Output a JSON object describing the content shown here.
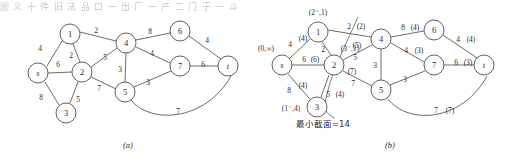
{
  "figure": {
    "top_cut_text": "图 义 十 件 旧 法 品 口 一 出 厂 一 产 二 门 于 一 斗",
    "panels": [
      {
        "id": "a",
        "caption": "(a)",
        "nodes": [
          {
            "id": "s",
            "label": "s",
            "italic": true,
            "x": 38,
            "y": 73
          },
          {
            "id": "1",
            "label": "1",
            "italic": false,
            "x": 70,
            "y": 34
          },
          {
            "id": "2",
            "label": "2",
            "italic": false,
            "x": 82,
            "y": 72
          },
          {
            "id": "3",
            "label": "3",
            "italic": false,
            "x": 66,
            "y": 113
          },
          {
            "id": "4",
            "label": "4",
            "italic": false,
            "x": 126,
            "y": 43
          },
          {
            "id": "5",
            "label": "5",
            "italic": false,
            "x": 125,
            "y": 92
          },
          {
            "id": "6",
            "label": "6",
            "italic": false,
            "x": 180,
            "y": 31
          },
          {
            "id": "7",
            "label": "7",
            "italic": false,
            "x": 180,
            "y": 66
          },
          {
            "id": "t",
            "label": "t",
            "italic": true,
            "x": 228,
            "y": 66
          }
        ],
        "edges": [
          {
            "from": "s",
            "to": "1",
            "label": "4",
            "lx": 40,
            "ly": 48
          },
          {
            "from": "s",
            "to": "2",
            "label": "6",
            "lx": 58,
            "ly": 64
          },
          {
            "from": "s",
            "to": "3",
            "label": "8",
            "lx": 41,
            "ly": 97
          },
          {
            "from": "1",
            "to": "2",
            "label": "2",
            "lx": 71,
            "ly": 55
          },
          {
            "from": "1",
            "to": "4",
            "label": "2",
            "lx": 96,
            "ly": 30
          },
          {
            "from": "2",
            "to": "3",
            "label": "5",
            "lx": 78,
            "ly": 99
          },
          {
            "from": "2",
            "to": "4",
            "label": "5",
            "lx": 105,
            "ly": 57
          },
          {
            "from": "2",
            "to": "5",
            "label": "7",
            "lx": 99,
            "ly": 88
          },
          {
            "from": "4",
            "to": "5",
            "label": "3",
            "lx": 120,
            "ly": 69
          },
          {
            "from": "4",
            "to": "6",
            "label": "8",
            "lx": 150,
            "ly": 31
          },
          {
            "from": "4",
            "to": "7",
            "label": "4",
            "lx": 152,
            "ly": 53
          },
          {
            "from": "5",
            "to": "7",
            "label": "3",
            "lx": 148,
            "ly": 82
          },
          {
            "from": "6",
            "to": "t",
            "label": "4",
            "lx": 207,
            "ly": 40
          },
          {
            "from": "7",
            "to": "t",
            "label": "6",
            "lx": 203,
            "ly": 64
          },
          {
            "from": "5",
            "to": "t",
            "label": "7",
            "lx": 178,
            "ly": 111,
            "curved": true
          }
        ]
      },
      {
        "id": "b",
        "caption": "(b)",
        "min_cut_text": "最小截面=14",
        "nodes": [
          {
            "id": "s",
            "label": "s",
            "italic": true,
            "x": 282,
            "y": 65
          },
          {
            "id": "1",
            "label": "1",
            "italic": false,
            "x": 318,
            "y": 32
          },
          {
            "id": "2",
            "label": "2",
            "italic": false,
            "x": 334,
            "y": 65
          },
          {
            "id": "3",
            "label": "3",
            "italic": false,
            "x": 317,
            "y": 107
          },
          {
            "id": "4",
            "label": "4",
            "italic": false,
            "x": 381,
            "y": 39
          },
          {
            "id": "5",
            "label": "5",
            "italic": false,
            "x": 381,
            "y": 90
          },
          {
            "id": "6",
            "label": "6",
            "italic": false,
            "x": 434,
            "y": 30
          },
          {
            "id": "7",
            "label": "7",
            "italic": false,
            "x": 434,
            "y": 65
          },
          {
            "id": "t",
            "label": "t",
            "italic": true,
            "x": 484,
            "y": 65
          }
        ],
        "node_tags": [
          {
            "node": "s",
            "text": "(0,∞)",
            "x": 266,
            "y": 48
          },
          {
            "node": "1",
            "text": "(2⁻,1)",
            "x": 318,
            "y": 12
          },
          {
            "node": "2",
            "text": "(3⁻,1)",
            "x": 350,
            "y": 48
          },
          {
            "node": "3",
            "text": "(1⁻,4)",
            "x": 291,
            "y": 108
          }
        ],
        "edges": [
          {
            "from": "s",
            "to": "1",
            "cap": "4",
            "flow": "(4)",
            "lx": 290,
            "ly": 44,
            "fx": 303,
            "fy": 38
          },
          {
            "from": "s",
            "to": "2",
            "cap": "6",
            "flow": "(6)",
            "lx": 304,
            "ly": 59,
            "fx": 315,
            "fy": 59
          },
          {
            "from": "s",
            "to": "3",
            "cap": "8",
            "flow": "(4)",
            "lx": 289,
            "ly": 90,
            "fx": 303,
            "fy": 85
          },
          {
            "from": "1",
            "to": "2",
            "cap": "2",
            "flow": "",
            "lx": 323,
            "ly": 49,
            "fx": 0,
            "fy": 0
          },
          {
            "from": "1",
            "to": "4",
            "cap": "2",
            "flow": "(2)",
            "lx": 349,
            "ly": 26,
            "fx": 361,
            "fy": 26
          },
          {
            "from": "2",
            "to": "3",
            "cap": "5",
            "flow": "(4)",
            "lx": 328,
            "ly": 94,
            "fx": 340,
            "fy": 94
          },
          {
            "from": "2",
            "to": "4",
            "cap": "5",
            "flow": "(5)",
            "lx": 355,
            "ly": 57,
            "fx": 357,
            "fy": 45
          },
          {
            "from": "2",
            "to": "5",
            "cap": "7",
            "flow": "(7)",
            "lx": 353,
            "ly": 83,
            "fx": 352,
            "fy": 71
          },
          {
            "from": "4",
            "to": "5",
            "cap": "3",
            "flow": "",
            "lx": 375,
            "ly": 65,
            "fx": 0,
            "fy": 0
          },
          {
            "from": "4",
            "to": "6",
            "cap": "8",
            "flow": "(4)",
            "lx": 403,
            "ly": 27,
            "fx": 415,
            "fy": 27
          },
          {
            "from": "4",
            "to": "7",
            "cap": "4",
            "flow": "(3)",
            "lx": 406,
            "ly": 50,
            "fx": 419,
            "fy": 50
          },
          {
            "from": "5",
            "to": "7",
            "cap": "3",
            "flow": "",
            "lx": 405,
            "ly": 79,
            "fx": 0,
            "fy": 0
          },
          {
            "from": "6",
            "to": "t",
            "cap": "4",
            "flow": "(4)",
            "lx": 458,
            "ly": 39,
            "fx": 471,
            "fy": 39
          },
          {
            "from": "7",
            "to": "t",
            "cap": "6",
            "flow": "(3)",
            "lx": 456,
            "ly": 62,
            "fx": 468,
            "fy": 62
          },
          {
            "from": "5",
            "to": "t",
            "cap": "7",
            "flow": "(7)",
            "lx": 436,
            "ly": 110,
            "fx": 450,
            "fy": 110,
            "curved": true
          }
        ]
      }
    ]
  }
}
